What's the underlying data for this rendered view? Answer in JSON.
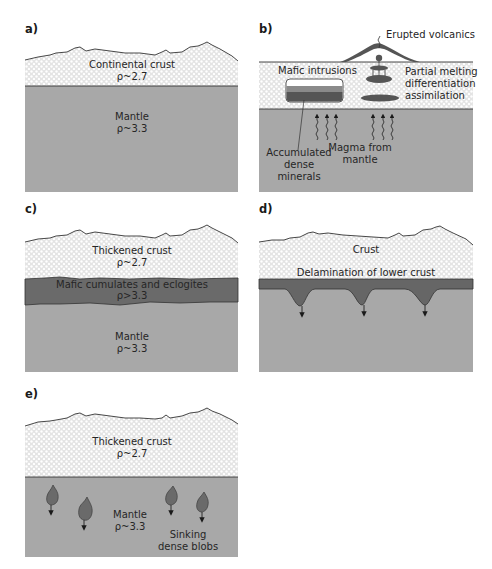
{
  "colors": {
    "crust_bg": "#e9e9e9",
    "crust_dot": "#ffffff",
    "mantle": "#a8a8a8",
    "dense": "#666666",
    "mid_band": "#8a8a8a",
    "line": "#333333"
  },
  "panels": {
    "a": {
      "label": "a)",
      "crust": {
        "name": "Continental crust",
        "density": "ρ~2.7"
      },
      "mantle": {
        "name": "Mantle",
        "density": "ρ~3.3"
      }
    },
    "b": {
      "label": "b)",
      "erupted": "Erupted volcanics",
      "mafic_intrusions": "Mafic intrusions",
      "partial_melting": [
        "Partial melting",
        "differentiation",
        "assimilation"
      ],
      "accumulated": [
        "Accumulated",
        "dense",
        "minerals"
      ],
      "magma": [
        "Magma from",
        "mantle"
      ]
    },
    "c": {
      "label": "c)",
      "crust": {
        "name": "Thickened crust",
        "density": "ρ~2.7"
      },
      "cumulates": {
        "name": "Mafic cumulates and eclogites",
        "density": "ρ>3.3"
      },
      "mantle": {
        "name": "Mantle",
        "density": "ρ~3.3"
      }
    },
    "d": {
      "label": "d)",
      "crust": {
        "name": "Crust"
      },
      "delamination": "Delamination of lower crust"
    },
    "e": {
      "label": "e)",
      "crust": {
        "name": "Thickened crust",
        "density": "ρ~2.7"
      },
      "mantle": {
        "name": "Mantle",
        "density": "ρ~3.3"
      },
      "blobs": [
        "Sinking",
        "dense blobs"
      ]
    }
  }
}
